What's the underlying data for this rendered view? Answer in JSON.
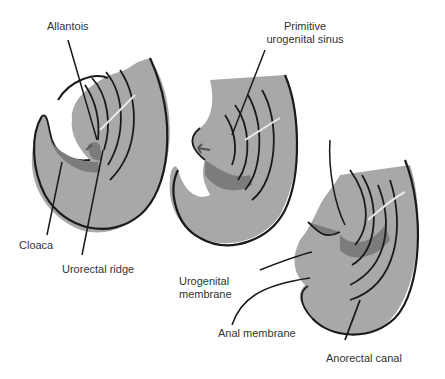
{
  "diagram": {
    "stages": [
      {
        "id": "stage-1",
        "labels": [
          "Allantois",
          "Cloaca",
          "Urorectal ridge"
        ]
      },
      {
        "id": "stage-2",
        "labels": [
          "Primitive urogenital sinus"
        ]
      },
      {
        "id": "stage-3",
        "labels": [
          "Urogenital membrane",
          "Anal membrane",
          "Anorectal canal"
        ]
      }
    ],
    "labels": {
      "allantois": "Allantois",
      "primitive_line1": "Primitive",
      "primitive_line2": "urogenital sinus",
      "cloaca": "Cloaca",
      "urorectal_ridge": "Urorectal ridge",
      "urogenital_line1": "Urogenital",
      "urogenital_line2": "membrane",
      "anal_membrane": "Anal membrane",
      "anorectal_canal": "Anorectal canal"
    },
    "colors": {
      "tissue_light": "#a8a8a8",
      "tissue_dark": "#7c7c7c",
      "outline": "#1a1a1a",
      "highlight": "#e8e8e8",
      "text": "#333333"
    }
  }
}
